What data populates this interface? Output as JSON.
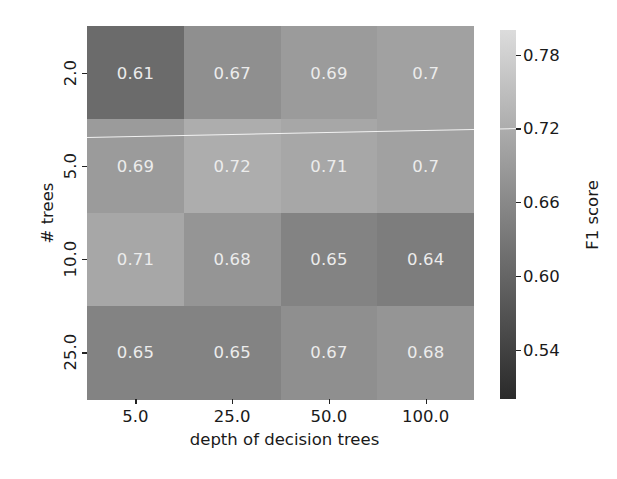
{
  "chart_data": {
    "type": "heatmap",
    "title": "",
    "xlabel": "depth of decision trees",
    "ylabel": "# trees",
    "x_categories": [
      "5.0",
      "25.0",
      "50.0",
      "100.0"
    ],
    "y_categories": [
      "2.0",
      "5.0",
      "10.0",
      "25.0"
    ],
    "values": [
      [
        0.61,
        0.67,
        0.69,
        0.7
      ],
      [
        0.69,
        0.72,
        0.71,
        0.7
      ],
      [
        0.71,
        0.68,
        0.65,
        0.64
      ],
      [
        0.65,
        0.65,
        0.67,
        0.68
      ]
    ],
    "cell_labels": [
      [
        "0.61",
        "0.67",
        "0.69",
        "0.7"
      ],
      [
        "0.69",
        "0.72",
        "0.71",
        "0.7"
      ],
      [
        "0.71",
        "0.68",
        "0.65",
        "0.64"
      ],
      [
        "0.65",
        "0.65",
        "0.67",
        "0.68"
      ]
    ],
    "colorbar": {
      "label": "F1 score",
      "ticks": [
        "0.54",
        "0.60",
        "0.66",
        "0.72",
        "0.78"
      ],
      "tick_values": [
        0.54,
        0.6,
        0.66,
        0.72,
        0.78
      ],
      "range": [
        0.5,
        0.8
      ],
      "colormap": "grayscale",
      "color_low": "#2a2a2a",
      "color_high": "#dcdcdc"
    },
    "grid": false,
    "annotations": true
  }
}
